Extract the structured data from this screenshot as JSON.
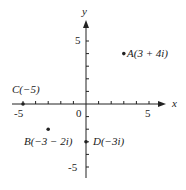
{
  "diagram": {
    "axes": {
      "x_label": "x",
      "y_label": "y",
      "origin_label": "0",
      "x_ticks": [
        "-5",
        "5"
      ],
      "y_ticks": [
        "5",
        "-5"
      ]
    },
    "points": [
      {
        "name": "A",
        "label": "A(3 + 4i)",
        "re": 3,
        "im": 4
      },
      {
        "name": "B",
        "label": "B(−3 − 2i)",
        "re": -3,
        "im": -2
      },
      {
        "name": "C",
        "label": "C(−5)",
        "re": -5,
        "im": 0
      },
      {
        "name": "D",
        "label": "D(−3i)",
        "re": 0,
        "im": -3
      }
    ],
    "colors": {
      "ink": "#222222",
      "background": "#ffffff"
    }
  }
}
